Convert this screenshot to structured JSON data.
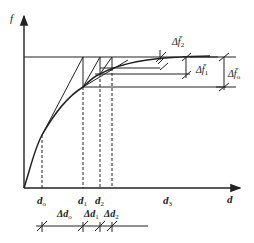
{
  "diagram": {
    "axes": {
      "y_label": "f",
      "x_label": "d"
    },
    "x_ticks": [
      {
        "id": "d0",
        "base": "d",
        "sub": "o",
        "x": 42
      },
      {
        "id": "d1",
        "base": "d",
        "sub": "1",
        "x": 83
      },
      {
        "id": "d2",
        "base": "d",
        "sub": "2",
        "x": 100
      },
      {
        "id": "d3",
        "base": "d",
        "sub": "3",
        "x": 168
      }
    ],
    "delta_d_labels": [
      {
        "id": "dd0",
        "text": "Δd",
        "sub": "o"
      },
      {
        "id": "dd1",
        "text": "Δd",
        "sub": "1"
      },
      {
        "id": "dd2",
        "text": "Δd",
        "sub": "2"
      }
    ],
    "delta_f_labels": [
      {
        "id": "df2",
        "text": "Δf̄",
        "sub": "2"
      },
      {
        "id": "df1",
        "text": "Δf̄",
        "sub": "1"
      },
      {
        "id": "df0",
        "text": "Δf̄",
        "sub": "o"
      }
    ],
    "colors": {
      "stroke": "#222222",
      "background": "#ffffff"
    }
  }
}
